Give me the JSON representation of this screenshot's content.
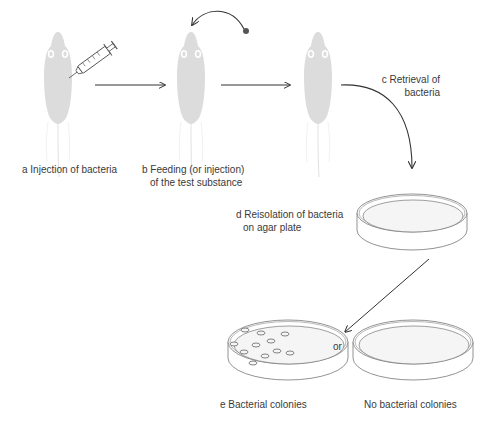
{
  "diagram": {
    "type": "experimental-procedure-flow",
    "colors": {
      "mouse_fill": "#dcdcdc",
      "line": "#333333",
      "dish_line": "#777777",
      "agar_fill": "#f4f4f4",
      "text": "#3a3a3a"
    },
    "steps": [
      {
        "id": "a",
        "label": "a Injection of bacteria",
        "icon": "mouse-with-syringe-icon"
      },
      {
        "id": "b",
        "label_line1": "b Feeding (or injection)",
        "label_line2": "of the test substance",
        "icon": "mouse-feeding-icon"
      },
      {
        "id": "c",
        "label_line1": "c Retrieval of",
        "label_line2": "bacteria",
        "icon": "mouse-icon"
      },
      {
        "id": "d",
        "label_line1": "d Reisolation of bacteria",
        "label_line2": "on agar plate",
        "icon": "petri-dish-icon"
      },
      {
        "id": "e",
        "label": "e  Bacterial colonies",
        "icon": "petri-dish-with-colonies-icon"
      },
      {
        "id": "e-alt",
        "label": "No bacterial colonies",
        "icon": "empty-petri-dish-icon"
      }
    ],
    "connector_word": "or",
    "colony_count": 11
  }
}
